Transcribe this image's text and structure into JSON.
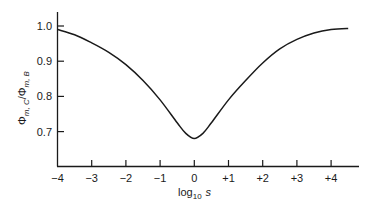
{
  "chart_data": {
    "type": "line",
    "title": "",
    "xlabel": "log10 s",
    "xlabel_main": "log",
    "xlabel_sub": "10",
    "xlabel_var": "s",
    "ylabel": "Φm,C/Φm,B",
    "ylabel_main1": "Φ",
    "ylabel_sub1": "m, C",
    "ylabel_main2": "/Φ",
    "ylabel_sub2": "m, B",
    "xlim": [
      -4,
      4.7
    ],
    "ylim": [
      0.6,
      1.04
    ],
    "x_ticks": [
      "-4",
      "-3",
      "-2",
      "-1",
      "0",
      "+1",
      "+2",
      "+3",
      "+4"
    ],
    "y_ticks": [
      "0.7",
      "0.8",
      "0.9",
      "1.0"
    ],
    "grid": false,
    "legend": null,
    "series": [
      {
        "name": "ratio",
        "x": [
          -4,
          -3.5,
          -3,
          -2.5,
          -2,
          -1.5,
          -1,
          -0.5,
          -0.25,
          0,
          0.25,
          0.5,
          1,
          1.5,
          2,
          2.5,
          3,
          3.5,
          4,
          4.5
        ],
        "y": [
          0.99,
          0.975,
          0.952,
          0.925,
          0.89,
          0.845,
          0.79,
          0.725,
          0.695,
          0.68,
          0.695,
          0.725,
          0.79,
          0.845,
          0.895,
          0.935,
          0.962,
          0.98,
          0.99,
          0.993
        ]
      }
    ]
  }
}
